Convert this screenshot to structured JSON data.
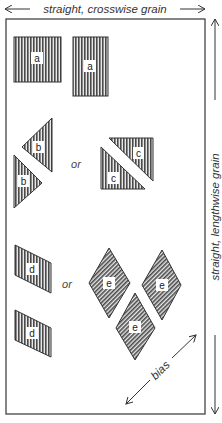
{
  "diagram": {
    "top_caption": "straight, crosswise grain",
    "side_caption": "straight, lengthwise grain",
    "bias_caption": "bias",
    "or_label_1": "or",
    "or_label_2": "or",
    "pieces": {
      "a1": "a",
      "a2": "a",
      "b1": "b",
      "b2": "b",
      "c1": "c",
      "c2": "c",
      "d1": "d",
      "d2": "d",
      "e1": "e",
      "e2": "e",
      "e3": "e"
    },
    "colors": {
      "fabric_fill": "#6e6e6e",
      "outline": "#333333",
      "label_bg": "#ffffff"
    }
  }
}
